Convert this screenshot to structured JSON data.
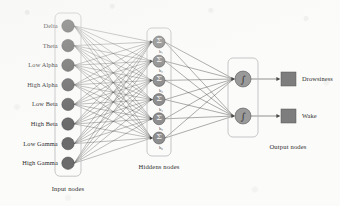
{
  "diagram": {
    "type": "feedforward-neural-network",
    "colors": {
      "input_node": "#6b6b6b",
      "hidden_node": "#8e8e8e",
      "output_node": "#9a9a9a",
      "output_square": "#7d7d7d",
      "edge": "#4a4a4a",
      "container_border": "#b9b9b9",
      "text": "#2e2e2e",
      "background": "#fbfbfa"
    },
    "layers": {
      "input": {
        "group_label": "Input nodes",
        "count": 8,
        "nodes": [
          {
            "label": "Delta"
          },
          {
            "label": "Theta"
          },
          {
            "label": "Low Alpha"
          },
          {
            "label": "High Alpha"
          },
          {
            "label": "Low Beta"
          },
          {
            "label": "High Beta"
          },
          {
            "label": "Low Gamma"
          },
          {
            "label": "High Gamma"
          }
        ]
      },
      "hidden": {
        "group_label": "Hiddens nodes",
        "count": 6,
        "node_glyph": "Σ",
        "nodes": [
          {
            "bias": "b₁"
          },
          {
            "bias": "b₂"
          },
          {
            "bias": "b₃"
          },
          {
            "bias": "b₄"
          },
          {
            "bias": "b₅"
          },
          {
            "bias": "b₆"
          }
        ]
      },
      "output": {
        "group_label": "Output nodes",
        "count": 2,
        "node_glyph": "∫",
        "nodes": [
          {
            "label": "Drowsiness"
          },
          {
            "label": "Wake"
          }
        ]
      }
    }
  }
}
